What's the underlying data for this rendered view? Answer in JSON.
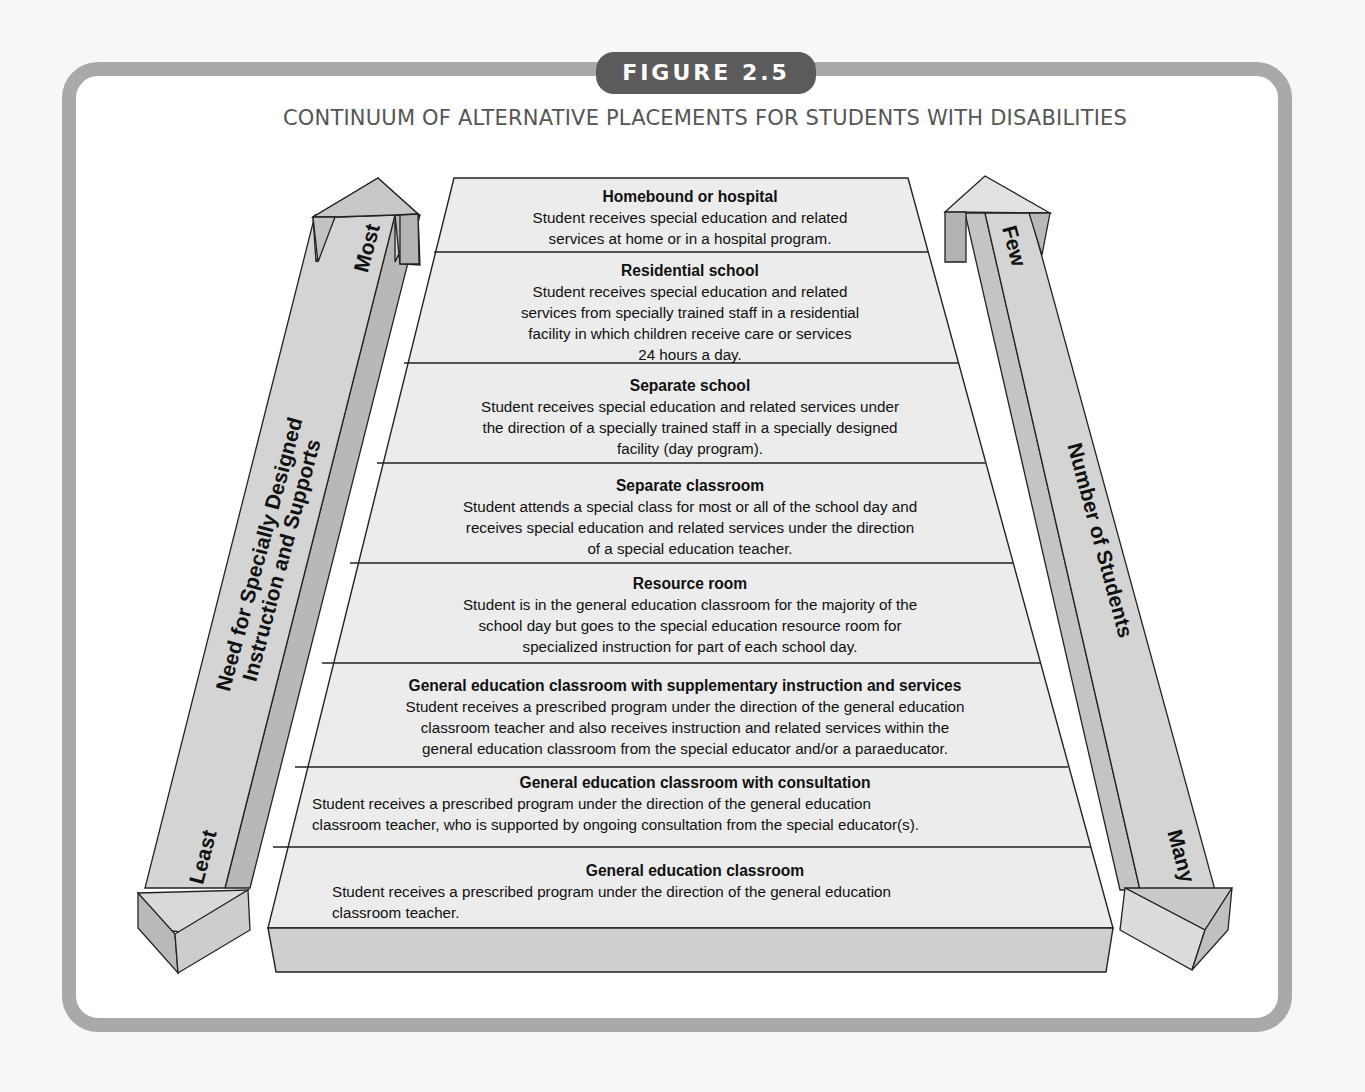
{
  "figure": {
    "badge": "FIGURE 2.5",
    "title": "CONTINUUM OF ALTERNATIVE PLACEMENTS FOR STUDENTS WITH DISABILITIES"
  },
  "colors": {
    "frame": "#a9a9a9",
    "badge_bg": "#5b5b5b",
    "tier_fill": "#e9e9e9",
    "slab_fill": "#cfcfcf",
    "arrow_fill_light": "#d6d6d6",
    "arrow_fill_dark": "#b5b5b5"
  },
  "left_arrow": {
    "label_line1": "Need for Specially Designed",
    "label_line2": "Instruction and Supports",
    "top_label": "Most",
    "bottom_label": "Least"
  },
  "right_arrow": {
    "label": "Number of Students",
    "top_label": "Few",
    "bottom_label": "Many"
  },
  "tiers": [
    {
      "heading": "Homebound or hospital",
      "lines": [
        "Student receives special education and related",
        "services at home or in a hospital program."
      ]
    },
    {
      "heading": "Residential school",
      "lines": [
        "Student receives special education and related",
        "services from specially trained staff in a residential",
        "facility in which children receive care or services",
        "24 hours a day."
      ]
    },
    {
      "heading": "Separate school",
      "lines": [
        "Student receives special education and related services under",
        "the direction of a specially trained staff in a specially designed",
        "facility (day program)."
      ]
    },
    {
      "heading": "Separate classroom",
      "lines": [
        "Student attends a special class for most or all of the school day and",
        "receives special education and related services under the direction",
        "of a special education teacher."
      ]
    },
    {
      "heading": "Resource room",
      "lines": [
        "Student is in the general education classroom for the majority of the",
        "school day but goes to the special education resource room for",
        "specialized instruction for part of each school day."
      ]
    },
    {
      "heading": "General education classroom with supplementary instruction and services",
      "lines": [
        "Student receives a prescribed program under the direction of the general education",
        "classroom teacher and also receives instruction and related services within the",
        "general education classroom from the special educator and/or a paraeducator."
      ]
    },
    {
      "heading": "General education classroom with consultation",
      "lines": [
        "Student receives a prescribed program under the direction of the general education",
        "classroom teacher, who is supported by ongoing consultation from the special educator(s)."
      ]
    },
    {
      "heading": "General education classroom",
      "lines": [
        "Student receives a prescribed program under the direction of the general education",
        "classroom teacher."
      ]
    }
  ]
}
